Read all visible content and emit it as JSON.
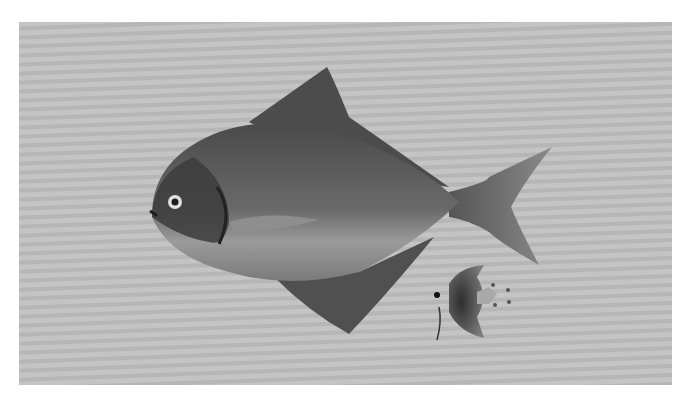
{
  "image": {
    "description": "Grayscale photograph of an adult pomfret fish and a juvenile fish on a gray striped background",
    "subjects": [
      {
        "name": "adult-pomfret",
        "role": "main subject"
      },
      {
        "name": "juvenile-fish",
        "role": "secondary subject"
      }
    ],
    "colors": {
      "border": "#ffffff",
      "background": "#bdbdbd",
      "fish_dark": "#3a3a3a",
      "fish_mid": "#6e6e6e",
      "fish_belly": "#a8a8a8"
    }
  }
}
